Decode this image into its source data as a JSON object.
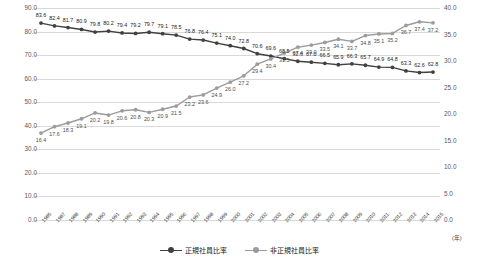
{
  "chart_data": {
    "type": "line",
    "title": "",
    "xlabel": "(年)",
    "ylabel": "",
    "ylim": [
      0,
      90
    ],
    "y2lim": [
      0,
      40
    ],
    "grid": true,
    "legend_position": "bottom",
    "categories": [
      "1985",
      "1987",
      "1988",
      "1989",
      "1990",
      "1991",
      "1992",
      "1993",
      "1994",
      "1995",
      "1996",
      "1997",
      "1998",
      "1999",
      "2000",
      "2001",
      "2002",
      "2003",
      "2004",
      "2005",
      "2006",
      "2007",
      "2008",
      "2009",
      "2010",
      "2011",
      "2012",
      "2013",
      "2014",
      "2015"
    ],
    "series": [
      {
        "name": "正規社員比率",
        "axis": "left",
        "color": "#404040",
        "values": [
          83.6,
          82.4,
          81.7,
          80.9,
          79.8,
          80.2,
          79.4,
          79.2,
          79.7,
          79.1,
          78.5,
          76.8,
          76.4,
          75.1,
          74.0,
          72.8,
          70.6,
          69.6,
          68.5,
          67.4,
          67.0,
          66.5,
          65.9,
          66.3,
          65.7,
          64.9,
          64.8,
          63.3,
          62.6,
          62.8
        ]
      },
      {
        "name": "非正規社員比率",
        "axis": "right",
        "color": "#9c9c9c",
        "values": [
          16.4,
          17.6,
          18.3,
          19.1,
          20.2,
          19.8,
          20.6,
          20.8,
          20.3,
          20.9,
          21.5,
          23.2,
          23.6,
          24.9,
          26.0,
          27.2,
          29.4,
          30.4,
          31.5,
          32.6,
          33.0,
          33.5,
          34.1,
          33.7,
          34.8,
          35.1,
          35.2,
          36.7,
          37.4,
          37.2
        ]
      }
    ],
    "yticks_left": [
      "90.0",
      "80.0",
      "70.0",
      "60.0",
      "50.0",
      "40.0",
      "30.0",
      "20.0",
      "10.0",
      "0.0"
    ],
    "yticks_right": [
      "40.0",
      "35.0",
      "30.0",
      "25.0",
      "20.0",
      "15.0",
      "10.0",
      "5.0",
      "0.0"
    ]
  }
}
